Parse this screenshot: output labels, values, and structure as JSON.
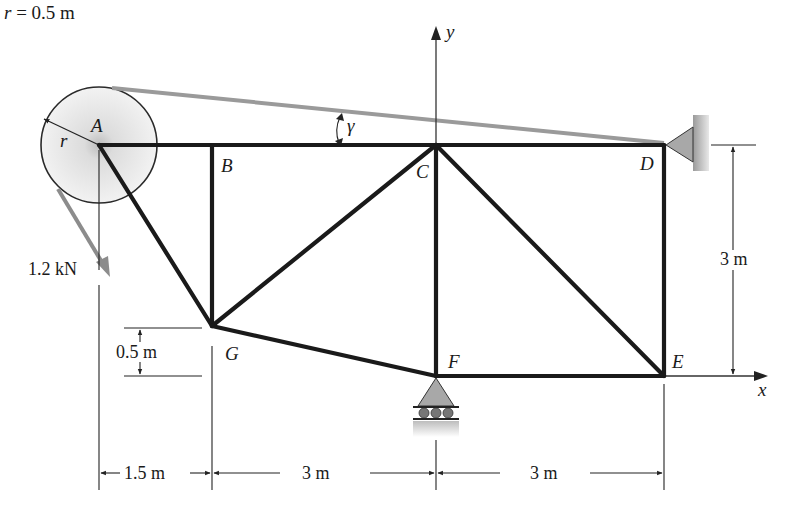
{
  "diagram": {
    "colors": {
      "member": "#1a1a1a",
      "cable": "#9a9a9a",
      "force_arrow": "#8c8c8c",
      "support_fill": "#a8a8a8",
      "pulley_fill": "#e4e4e4",
      "dimension": "#222222"
    },
    "nodes": [
      {
        "id": "A",
        "label": "A",
        "x": 99,
        "y": 145
      },
      {
        "id": "B",
        "label": "B",
        "x": 212,
        "y": 145
      },
      {
        "id": "C",
        "label": "C",
        "x": 436,
        "y": 145
      },
      {
        "id": "D",
        "label": "D",
        "x": 664,
        "y": 145
      },
      {
        "id": "E",
        "label": "E",
        "x": 664,
        "y": 376
      },
      {
        "id": "F",
        "label": "F",
        "x": 436,
        "y": 376
      },
      {
        "id": "G",
        "label": "G",
        "x": 212,
        "y": 326
      }
    ],
    "members": [
      "AB",
      "BC",
      "CD",
      "AG",
      "BG",
      "GC",
      "GF",
      "CF",
      "CE",
      "DE",
      "FE"
    ],
    "pulley": {
      "center": "A",
      "radius_label": "r",
      "radius_value": "r = 0.5 m"
    },
    "force": {
      "label": "1.2 kN",
      "direction": "down-right along cable"
    },
    "cable_angle_label": "γ",
    "supports": [
      {
        "node": "D",
        "type": "pin to wall"
      },
      {
        "node": "F",
        "type": "roller"
      }
    ],
    "axes": {
      "x_label": "x",
      "y_label": "y"
    },
    "dimensions": {
      "horizontal": [
        "1.5 m",
        "3 m",
        "3 m"
      ],
      "vertical_height": "3 m",
      "g_offset": "0.5 m"
    }
  }
}
